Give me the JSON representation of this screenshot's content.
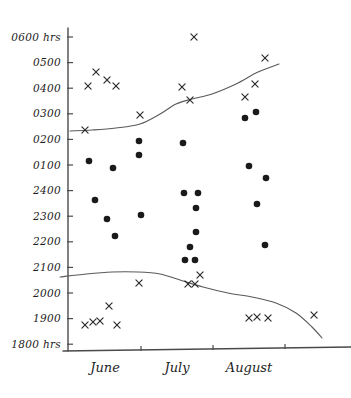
{
  "chart_data": {
    "type": "scatter",
    "title": "",
    "subtitle": "",
    "xlabel": "",
    "ylabel": "",
    "grid": false,
    "legend_position": "none",
    "y_axis": {
      "unit": "hrs",
      "tick_labels": [
        "0600 hrs",
        "0500",
        "0400",
        "0300",
        "0200",
        "0100",
        "2400",
        "2300",
        "2200",
        "2100",
        "2000",
        "1900",
        "1800 hrs"
      ],
      "tick_values": [
        600,
        500,
        400,
        300,
        200,
        100,
        2400,
        2300,
        2200,
        2100,
        2000,
        1900,
        1800
      ],
      "scale_note": "Clock time running from 1800 hrs at bottom to 0600 hrs at top (overnight)",
      "ylim": [
        1800,
        600
      ]
    },
    "x_axis": {
      "tick_labels": [
        "June",
        "July",
        "August"
      ],
      "categories": [
        "June",
        "July",
        "August"
      ],
      "xlim": [
        "early June",
        "late August"
      ]
    },
    "series": [
      {
        "name": "x-markers",
        "marker": "x",
        "points": [
          {
            "month": "June",
            "time": "0405",
            "x": 88,
            "y": 86
          },
          {
            "month": "June",
            "time": "0440",
            "x": 96,
            "y": 72
          },
          {
            "month": "June",
            "time": "0420",
            "x": 107,
            "y": 80
          },
          {
            "month": "June",
            "time": "0405",
            "x": 116,
            "y": 86
          },
          {
            "month": "June",
            "time": "0235",
            "x": 85,
            "y": 130
          },
          {
            "month": "June",
            "time": "1955",
            "x": 109,
            "y": 306
          },
          {
            "month": "June",
            "time": "1900",
            "x": 85,
            "y": 325
          },
          {
            "month": "June",
            "time": "1903",
            "x": 93,
            "y": 322
          },
          {
            "month": "June",
            "time": "1905",
            "x": 100,
            "y": 321
          },
          {
            "month": "June",
            "time": "1900",
            "x": 117,
            "y": 325
          },
          {
            "month": "July",
            "time": "0300",
            "x": 140,
            "y": 115
          },
          {
            "month": "July",
            "time": "2085",
            "x": 139,
            "y": 283
          },
          {
            "month": "July",
            "time": "0545",
            "x": 194,
            "y": 37
          },
          {
            "month": "July",
            "time": "0402",
            "x": 182,
            "y": 87
          },
          {
            "month": "July",
            "time": "0345",
            "x": 190,
            "y": 100
          },
          {
            "month": "July",
            "time": "2080",
            "x": 188,
            "y": 284
          },
          {
            "month": "July",
            "time": "2080",
            "x": 195,
            "y": 284
          },
          {
            "month": "July",
            "time": "2110",
            "x": 200,
            "y": 275
          },
          {
            "month": "August",
            "time": "0505",
            "x": 265,
            "y": 58
          },
          {
            "month": "August",
            "time": "0418",
            "x": 255,
            "y": 84
          },
          {
            "month": "August",
            "time": "0375",
            "x": 245,
            "y": 97
          },
          {
            "month": "August",
            "time": "1930",
            "x": 249,
            "y": 318
          },
          {
            "month": "August",
            "time": "1932",
            "x": 257,
            "y": 317
          },
          {
            "month": "August",
            "time": "1930",
            "x": 268,
            "y": 318
          },
          {
            "month": "August",
            "time": "1940",
            "x": 314,
            "y": 315
          }
        ]
      },
      {
        "name": "filled-dots",
        "marker": "dot",
        "points": [
          {
            "month": "June",
            "time": "0125",
            "x": 89,
            "y": 161
          },
          {
            "month": "June",
            "time": "2385",
            "x": 95,
            "y": 200
          },
          {
            "month": "June",
            "time": "2305",
            "x": 107,
            "y": 219
          },
          {
            "month": "June",
            "time": "0100",
            "x": 113,
            "y": 168
          },
          {
            "month": "June",
            "time": "2250",
            "x": 115,
            "y": 236
          },
          {
            "month": "June",
            "time": "0205",
            "x": 139,
            "y": 141
          },
          {
            "month": "June",
            "time": "0150",
            "x": 139,
            "y": 155
          },
          {
            "month": "June",
            "time": "2325",
            "x": 141,
            "y": 215
          },
          {
            "month": "July",
            "time": "0200",
            "x": 183,
            "y": 143
          },
          {
            "month": "July",
            "time": "2405",
            "x": 184,
            "y": 193
          },
          {
            "month": "July",
            "time": "2405",
            "x": 198,
            "y": 193
          },
          {
            "month": "July",
            "time": "2355",
            "x": 196,
            "y": 208
          },
          {
            "month": "July",
            "time": "2265",
            "x": 196,
            "y": 232
          },
          {
            "month": "July",
            "time": "2210",
            "x": 190,
            "y": 247
          },
          {
            "month": "July",
            "time": "2160",
            "x": 185,
            "y": 260
          },
          {
            "month": "July",
            "time": "2160",
            "x": 195,
            "y": 260
          },
          {
            "month": "August",
            "time": "0290",
            "x": 245,
            "y": 118
          },
          {
            "month": "August",
            "time": "0312",
            "x": 256,
            "y": 112
          },
          {
            "month": "August",
            "time": "0105",
            "x": 249,
            "y": 166
          },
          {
            "month": "August",
            "time": "0065",
            "x": 266,
            "y": 178
          },
          {
            "month": "August",
            "time": "2370",
            "x": 257,
            "y": 204
          },
          {
            "month": "August",
            "time": "2215",
            "x": 265,
            "y": 245
          }
        ]
      }
    ],
    "curves": [
      {
        "name": "sunrise-curve",
        "description": "Upper hand-drawn curve rising from about 0235 hrs in early June to about 0480 hrs by late August",
        "path_points": [
          {
            "x": 70,
            "y": 131
          },
          {
            "x": 92,
            "y": 130
          },
          {
            "x": 116,
            "y": 128
          },
          {
            "x": 140,
            "y": 124
          },
          {
            "x": 160,
            "y": 114
          },
          {
            "x": 176,
            "y": 104
          },
          {
            "x": 192,
            "y": 99
          },
          {
            "x": 212,
            "y": 94
          },
          {
            "x": 236,
            "y": 84
          },
          {
            "x": 258,
            "y": 72
          },
          {
            "x": 279,
            "y": 64
          }
        ]
      },
      {
        "name": "sunset-curve",
        "description": "Lower hand-drawn curve, flat near 2100 hrs through June and July then falling to about 1880 hrs at the end of August",
        "path_points": [
          {
            "x": 60,
            "y": 277
          },
          {
            "x": 86,
            "y": 274
          },
          {
            "x": 112,
            "y": 272
          },
          {
            "x": 138,
            "y": 272
          },
          {
            "x": 160,
            "y": 274
          },
          {
            "x": 180,
            "y": 280
          },
          {
            "x": 203,
            "y": 287
          },
          {
            "x": 228,
            "y": 293
          },
          {
            "x": 252,
            "y": 297
          },
          {
            "x": 276,
            "y": 303
          },
          {
            "x": 296,
            "y": 313
          },
          {
            "x": 312,
            "y": 327
          },
          {
            "x": 322,
            "y": 338
          }
        ]
      }
    ]
  },
  "axis": {
    "y_label_top": "0600 hrs",
    "y_label_bottom": "1800 hrs"
  }
}
